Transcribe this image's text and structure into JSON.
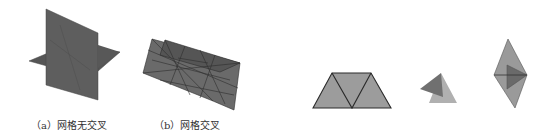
{
  "figures": [
    {
      "id": "a",
      "caption": "（a）网格无交叉",
      "description": "two planes crossing without mesh intersection"
    },
    {
      "id": "b",
      "caption": "（b）网格交叉",
      "description": "triangulated planes with intersecting mesh"
    },
    {
      "id": "c",
      "caption": "",
      "description": "trapezoid made of three triangles"
    },
    {
      "id": "d",
      "caption": "",
      "description": "small overlapping triangles"
    },
    {
      "id": "e",
      "caption": "",
      "description": "diamond with inner dark triangle"
    }
  ],
  "colors": {
    "dark_plane": "#5a5a5a",
    "mid_plane": "#6e6e6e",
    "light_fill": "#9a9a9a",
    "edge": "#2a2a2a"
  }
}
